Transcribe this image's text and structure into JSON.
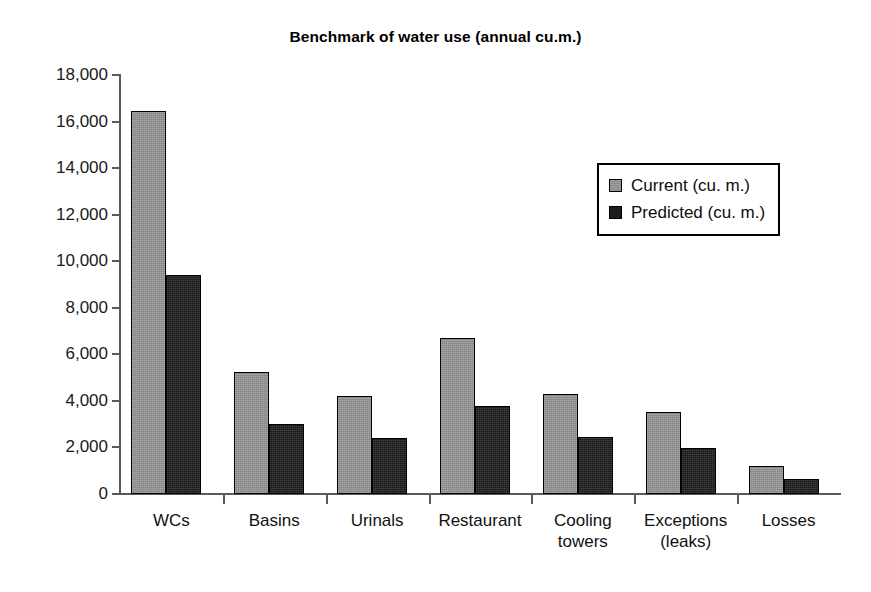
{
  "chart_data": {
    "type": "bar",
    "title": "Benchmark of water use (annual cu.m.)",
    "xlabel": "",
    "ylabel": "",
    "ylim": [
      0,
      18000
    ],
    "ytick_step": 2000,
    "yticks": [
      "18,000",
      "16,000",
      "14,000",
      "12,000",
      "10,000",
      "8,000",
      "6,000",
      "4,000",
      "2,000",
      "0"
    ],
    "ytick_values": [
      18000,
      16000,
      14000,
      12000,
      10000,
      8000,
      6000,
      4000,
      2000,
      0
    ],
    "grid": false,
    "legend_position": "upper right (inside plot)",
    "categories": [
      "WCs",
      "Basins",
      "Urinals",
      "Restaurant",
      "Cooling towers",
      "Exceptions (leaks)",
      "Losses"
    ],
    "category_lines": [
      [
        "WCs"
      ],
      [
        "Basins"
      ],
      [
        "Urinals"
      ],
      [
        "Restaurant"
      ],
      [
        "Cooling",
        "towers"
      ],
      [
        "Exceptions",
        "(leaks)"
      ],
      [
        "Losses"
      ]
    ],
    "series": [
      {
        "name": "Current (cu. m.)",
        "color": "#949494",
        "values": [
          16450,
          5240,
          4230,
          6720,
          4290,
          3520,
          1200
        ]
      },
      {
        "name": "Predicted (cu. m.)",
        "color": "#1d1d1d",
        "values": [
          9400,
          3000,
          2420,
          3760,
          2450,
          1970,
          650
        ]
      }
    ]
  },
  "legend": {
    "items": [
      {
        "label": "Current (cu. m.)",
        "swatch": "current"
      },
      {
        "label": "Predicted (cu. m.)",
        "swatch": "predicted"
      }
    ]
  }
}
